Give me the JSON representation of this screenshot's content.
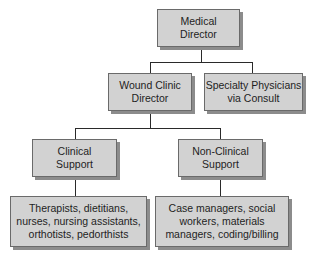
{
  "diagram": {
    "type": "org-chart",
    "nodes": [
      {
        "id": "medical-director",
        "label": "Medical\nDirector"
      },
      {
        "id": "wound-clinic-director",
        "label": "Wound Clinic\nDirector",
        "parent": "medical-director"
      },
      {
        "id": "specialty-physicians",
        "label": "Specialty Physicians\nvia Consult",
        "parent": "medical-director"
      },
      {
        "id": "clinical-support",
        "label": "Clinical\nSupport",
        "parent": "wound-clinic-director"
      },
      {
        "id": "non-clinical-support",
        "label": "Non-Clinical\nSupport",
        "parent": "wound-clinic-director"
      },
      {
        "id": "clinical-staff",
        "label": "Therapists, dietitians,\nnurses, nursing assistants,\northotists, pedorthists",
        "parent": "clinical-support"
      },
      {
        "id": "non-clinical-staff",
        "label": "Case managers, social\nworkers, materials\nmanagers, coding/billing",
        "parent": "non-clinical-support"
      }
    ]
  },
  "colors": {
    "box_fill": "#d2d2d2",
    "box_border": "#6a6a6a",
    "shadow": "#8c8c8c",
    "connector": "#2a2a2a"
  }
}
